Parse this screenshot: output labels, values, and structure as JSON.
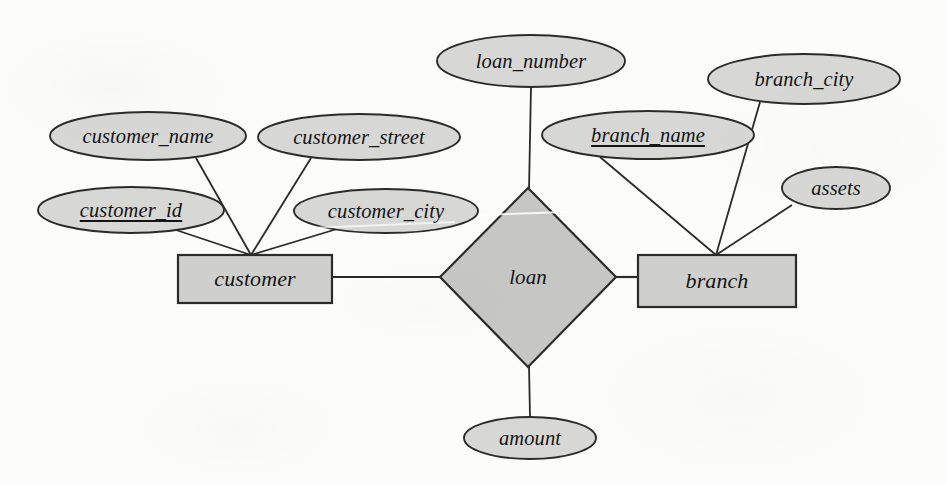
{
  "diagram": {
    "type": "entity-relationship",
    "notation": "chen",
    "colors": {
      "background": "#fcfcfb",
      "ellipse_fill": "#d7d7d5",
      "rectangle_fill": "#cfcfcd",
      "diamond_fill": "#c6c6c4",
      "stroke": "#2b2b2b",
      "text": "#141414"
    },
    "entities": [
      {
        "id": "customer",
        "label": "customer",
        "shape": "rectangle",
        "x": 178,
        "y": 255,
        "w": 154,
        "h": 48,
        "attribute_anchor": {
          "x": 251,
          "y": 255
        }
      },
      {
        "id": "branch",
        "label": "branch",
        "shape": "rectangle",
        "x": 638,
        "y": 255,
        "w": 158,
        "h": 52,
        "attribute_anchor": {
          "x": 716,
          "y": 255
        }
      }
    ],
    "relationships": [
      {
        "id": "loan",
        "label": "loan",
        "shape": "diamond",
        "cx": 528,
        "cy": 277,
        "rx": 88,
        "ry": 90,
        "connects": [
          "customer",
          "branch"
        ]
      }
    ],
    "attributes": [
      {
        "id": "customer_name",
        "label": "customer_name",
        "owner": "customer",
        "primary_key": false,
        "cx": 148,
        "cy": 136,
        "rx": 98,
        "ry": 24,
        "anchor": {
          "x": 196,
          "y": 158
        }
      },
      {
        "id": "customer_id",
        "label": "customer_id",
        "owner": "customer",
        "primary_key": true,
        "cx": 131,
        "cy": 210,
        "rx": 93,
        "ry": 23,
        "anchor": {
          "x": 176,
          "y": 230
        }
      },
      {
        "id": "customer_street",
        "label": "customer_street",
        "owner": "customer",
        "primary_key": false,
        "cx": 359,
        "cy": 137,
        "rx": 101,
        "ry": 23,
        "anchor": {
          "x": 311,
          "y": 158
        }
      },
      {
        "id": "customer_city",
        "label": "customer_city",
        "owner": "customer",
        "primary_key": false,
        "cx": 386,
        "cy": 211,
        "rx": 92,
        "ry": 22,
        "anchor": {
          "x": 337,
          "y": 229
        }
      },
      {
        "id": "loan_number",
        "label": "loan_number",
        "owner": "loan",
        "primary_key": false,
        "cx": 531,
        "cy": 61,
        "rx": 94,
        "ry": 26,
        "anchor": {
          "x": 531,
          "y": 87
        }
      },
      {
        "id": "amount",
        "label": "amount",
        "owner": "loan",
        "primary_key": false,
        "cx": 530,
        "cy": 438,
        "rx": 66,
        "ry": 21,
        "anchor": {
          "x": 530,
          "y": 417
        }
      },
      {
        "id": "branch_name",
        "label": "branch_name",
        "owner": "branch",
        "primary_key": true,
        "cx": 648,
        "cy": 135,
        "rx": 106,
        "ry": 24,
        "anchor": {
          "x": 600,
          "y": 157
        }
      },
      {
        "id": "branch_city",
        "label": "branch_city",
        "owner": "branch",
        "primary_key": false,
        "cx": 804,
        "cy": 79,
        "rx": 96,
        "ry": 25,
        "anchor": {
          "x": 760,
          "y": 102
        }
      },
      {
        "id": "assets",
        "label": "assets",
        "owner": "branch",
        "primary_key": false,
        "cx": 836,
        "cy": 188,
        "rx": 54,
        "ry": 21,
        "anchor": {
          "x": 792,
          "y": 205
        }
      }
    ]
  }
}
